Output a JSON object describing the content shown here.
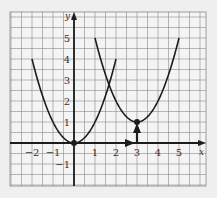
{
  "chart_data": {
    "type": "line",
    "title": "",
    "xlabel": "x",
    "ylabel": "y",
    "xlim": [
      -3,
      6.2
    ],
    "ylim": [
      -2,
      6.2
    ],
    "grid": true,
    "grid_step": 0.5,
    "x_ticks": [
      -2,
      -1,
      1,
      2,
      3,
      4,
      5
    ],
    "x_tick_labels": [
      "−2",
      "−1",
      "1",
      "2",
      "3",
      "4",
      "5"
    ],
    "y_ticks": [
      -1,
      1,
      2,
      3,
      4,
      5
    ],
    "y_tick_labels": [
      "−1",
      "1",
      "2",
      "3",
      "4",
      "5"
    ],
    "series": [
      {
        "name": "y = x²",
        "function": "x^2",
        "domain": [
          -2,
          2
        ],
        "vertex": [
          0,
          0
        ],
        "points": [
          [
            -2,
            4
          ],
          [
            -1,
            1
          ],
          [
            0,
            0
          ],
          [
            1,
            1
          ],
          [
            2,
            4
          ]
        ]
      },
      {
        "name": "y = (x − 3)² + 1",
        "function": "(x-3)^2+1",
        "domain": [
          1,
          5
        ],
        "vertex": [
          3,
          1
        ],
        "points": [
          [
            1,
            5
          ],
          [
            2,
            2
          ],
          [
            3,
            1
          ],
          [
            4,
            2
          ],
          [
            5,
            5
          ]
        ]
      }
    ],
    "annotations": [
      {
        "type": "dashed-arrow",
        "from": [
          0,
          0
        ],
        "to": [
          3,
          0
        ],
        "meaning": "horizontal translation 3 right"
      },
      {
        "type": "arrow",
        "from": [
          3,
          0
        ],
        "to": [
          3,
          1
        ],
        "meaning": "vertical translation 1 up"
      },
      {
        "type": "point",
        "at": [
          0,
          0
        ]
      },
      {
        "type": "point",
        "at": [
          3,
          1
        ]
      }
    ],
    "legend": null
  },
  "colors": {
    "background": "#efefef",
    "grid": "#8a8a8a",
    "ink": "#1c1c1c"
  }
}
